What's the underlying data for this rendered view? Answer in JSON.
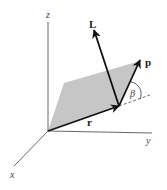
{
  "figure": {
    "colors": {
      "plane": "#c6c6c6",
      "vector": "#111111",
      "axis": "#555555"
    },
    "axes": {
      "x_label": "x",
      "y_label": "y",
      "z_label": "z"
    },
    "vectors": {
      "r_label": "r",
      "p_label": "p",
      "L_label": "L"
    },
    "angle_label": "β"
  }
}
